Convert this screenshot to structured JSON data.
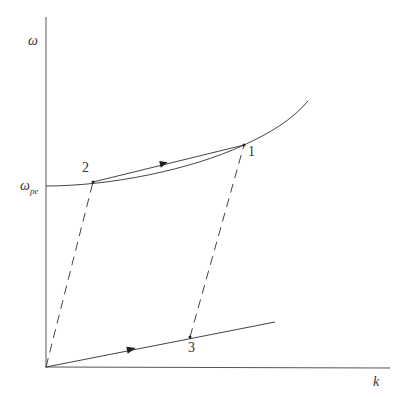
{
  "diagram": {
    "axes": {
      "y_label": "ω",
      "x_label": "k",
      "y_tick_label_main": "ω",
      "y_tick_label_sub": "pe"
    },
    "points": [
      {
        "id": "1",
        "label": "1"
      },
      {
        "id": "2",
        "label": "2"
      },
      {
        "id": "3",
        "label": "3"
      }
    ],
    "curves": [
      {
        "name": "upper-dispersion-curve",
        "style": "solid"
      },
      {
        "name": "chord-2-to-1",
        "style": "solid-with-arrow"
      },
      {
        "name": "lower-line",
        "style": "solid-with-arrow"
      },
      {
        "name": "dashed-0-to-2",
        "style": "dashed"
      },
      {
        "name": "dashed-3-to-1",
        "style": "dashed"
      }
    ],
    "colors": {
      "line": "#444444",
      "text": "#333333"
    }
  }
}
